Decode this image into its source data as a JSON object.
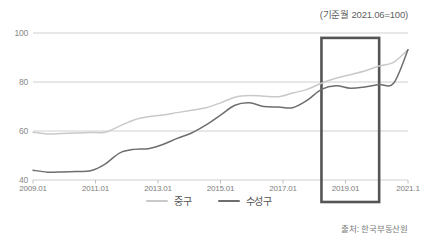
{
  "note": {
    "title": "(기준월 2021.06=100)",
    "source": "출처: 한국부동산원"
  },
  "legend": {
    "items": [
      {
        "label": "중구",
        "color": "#c9c9c9"
      },
      {
        "label": "수성구",
        "color": "#6e6e6e"
      }
    ]
  },
  "chart_data": {
    "type": "line",
    "title": "(기준월 2021.06=100)",
    "xlabel": "",
    "ylabel": "",
    "ylim": [
      40,
      100
    ],
    "yticks": [
      40,
      60,
      80,
      100
    ],
    "grid": true,
    "legend_position": "bottom-center",
    "annotations": [
      {
        "type": "highlight-box",
        "x_start": "2019.01",
        "x_end": "2021.01",
        "y_start": 40,
        "y_end": 98,
        "color": "#555555"
      }
    ],
    "x_tick_labels": [
      "2009.01",
      "2011.01",
      "2013.01",
      "2015.01",
      "2017.01",
      "2019.01",
      "2021.1"
    ],
    "x": [
      "2009.01",
      "2009.07",
      "2010.01",
      "2010.07",
      "2011.01",
      "2011.07",
      "2012.01",
      "2012.07",
      "2013.01",
      "2013.07",
      "2014.01",
      "2014.07",
      "2015.01",
      "2015.07",
      "2016.01",
      "2016.07",
      "2017.01",
      "2017.07",
      "2018.01",
      "2018.07",
      "2019.01",
      "2019.07",
      "2020.01",
      "2020.07",
      "2021.01",
      "2021.06",
      "2021.10"
    ],
    "series": [
      {
        "name": "중구",
        "color": "#c9c9c9",
        "values": [
          59.5,
          58.8,
          59.0,
          59.2,
          59.4,
          59.5,
          62.0,
          64.5,
          65.8,
          66.5,
          67.5,
          68.5,
          69.5,
          71.5,
          73.8,
          74.5,
          74.2,
          74.0,
          75.5,
          77.0,
          79.5,
          81.5,
          83.0,
          84.5,
          86.5,
          88.0,
          93.2
        ]
      },
      {
        "name": "수성구",
        "color": "#6e6e6e",
        "values": [
          44.0,
          43.2,
          43.3,
          43.5,
          43.8,
          46.5,
          51.0,
          52.5,
          52.8,
          54.5,
          57.0,
          59.2,
          62.5,
          66.5,
          70.5,
          71.5,
          70.0,
          69.8,
          69.5,
          72.5,
          77.0,
          78.5,
          77.5,
          78.0,
          79.0,
          79.5,
          93.2
        ]
      }
    ]
  }
}
